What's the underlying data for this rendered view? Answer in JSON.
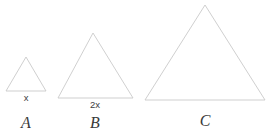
{
  "figure": {
    "background_color": "#ffffff",
    "stroke_color": "#c9c9c9",
    "text_color": "#3a3a3a",
    "width": 269,
    "height": 137
  },
  "diagram_data": {
    "type": "geometry-diagram",
    "shape": "triangle",
    "count": 3,
    "shapes": [
      {
        "name": "A",
        "label": "A",
        "side_label": "x",
        "base_length_px": 40,
        "height_px": 34,
        "apex": {
          "x": 26,
          "y": 57
        },
        "base_left": {
          "x": 6,
          "y": 91
        },
        "base_right": {
          "x": 46,
          "y": 91
        },
        "side_label_pos": {
          "x": 26,
          "y": 93
        },
        "fig_label_pos": {
          "x": 26,
          "y": 115
        }
      },
      {
        "name": "B",
        "label": "B",
        "side_label": "2x",
        "base_length_px": 75,
        "height_px": 65,
        "apex": {
          "x": 93,
          "y": 33
        },
        "base_left": {
          "x": 58,
          "y": 98
        },
        "base_right": {
          "x": 133,
          "y": 98
        },
        "side_label_pos": {
          "x": 95,
          "y": 100
        },
        "fig_label_pos": {
          "x": 95,
          "y": 115
        }
      },
      {
        "name": "C",
        "label": "C",
        "side_label": "",
        "base_length_px": 120,
        "height_px": 95,
        "apex": {
          "x": 205,
          "y": 5
        },
        "base_left": {
          "x": 145,
          "y": 100
        },
        "base_right": {
          "x": 265,
          "y": 100
        },
        "side_label_pos": null,
        "fig_label_pos": {
          "x": 205,
          "y": 113
        }
      }
    ]
  }
}
